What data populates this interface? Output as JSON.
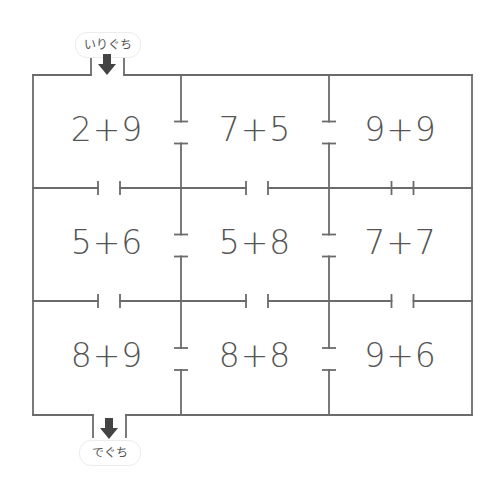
{
  "entrance": {
    "label": "いりぐち",
    "icon": "down-arrow-icon"
  },
  "exit": {
    "label": "でぐち",
    "icon": "down-arrow-icon"
  },
  "maze": {
    "rows": 3,
    "cols": 3,
    "cells": [
      [
        "2+9",
        "7+5",
        "9+9"
      ],
      [
        "5+6",
        "5+8",
        "7+7"
      ],
      [
        "8+9",
        "8+8",
        "9+6"
      ]
    ],
    "vertical_walls_open": [
      [
        true,
        true
      ],
      [
        true,
        true
      ],
      [
        true,
        true
      ]
    ],
    "horizontal_walls_open": [
      [
        true,
        true,
        false
      ],
      [
        true,
        true,
        true
      ]
    ],
    "entrance_column": 0,
    "exit_column": 0
  },
  "colors": {
    "line": "#6b6b6b",
    "text": "#555555",
    "arrow": "#444444",
    "pill_border": "#ececec"
  }
}
